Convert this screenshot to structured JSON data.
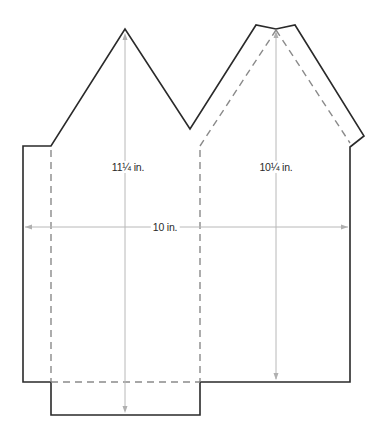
{
  "diagram": {
    "type": "house-pattern-template",
    "labels": {
      "left_height": "11¼ in.",
      "right_height": "10¼ in.",
      "width": "10 in."
    },
    "colors": {
      "outline": "#2a2a2a",
      "fold_line": "#8a8a8a",
      "dimension_line": "#b8b8b8",
      "background": "#ffffff"
    }
  }
}
